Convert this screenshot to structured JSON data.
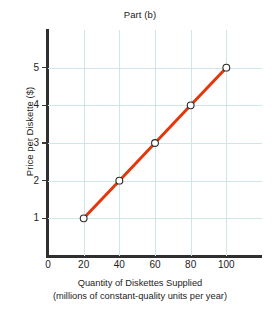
{
  "chart_data": {
    "type": "line",
    "title": "Part (b)",
    "xlabel": "Quantity of Diskettes Supplied",
    "xlabel_sub": "(millions of constant-quality units per year)",
    "ylabel": "Price per Diskette ($)",
    "x": [
      20,
      40,
      60,
      80,
      100
    ],
    "values": [
      1,
      2,
      3,
      4,
      5
    ],
    "series": [
      {
        "name": "Supply",
        "x": [
          20,
          40,
          60,
          80,
          100
        ],
        "values": [
          1,
          2,
          3,
          4,
          5
        ]
      }
    ],
    "xticks": [
      "0",
      "20",
      "40",
      "60",
      "80",
      "100"
    ],
    "xtick_values": [
      0,
      20,
      40,
      60,
      80,
      100
    ],
    "yticks": [
      "1",
      "2",
      "3",
      "4",
      "5"
    ],
    "ytick_values": [
      1,
      2,
      3,
      4,
      5
    ],
    "xlim": [
      0,
      120
    ],
    "ylim": [
      0,
      6
    ],
    "grid": true,
    "legend": "none",
    "line_color": "#e3380d",
    "grid_color": "#cfe6e8",
    "marker": "open-circle",
    "marker_face_color": "#ffffff",
    "marker_edge_color": "#2b2b2b"
  }
}
